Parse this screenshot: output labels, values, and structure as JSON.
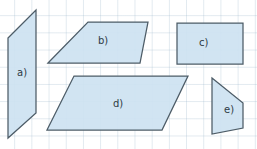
{
  "canvas": {
    "width": 257,
    "height": 149,
    "background_color": "#ffffff",
    "grid_color": "#96b2c8",
    "grid_spacing": 17.2
  },
  "style": {
    "shape_fill": "#cde2f1",
    "shape_stroke": "#4d5c67",
    "label_color": "#2e3b45"
  },
  "shapes": [
    {
      "id": "a",
      "label": "a)",
      "type": "parallelogram",
      "points": "8,38 36,10 36,113 8,138",
      "label_x": 17,
      "label_y": 68
    },
    {
      "id": "b",
      "label": "b)",
      "type": "parallelogram",
      "points": "48,63 88,22 148,22 140,63",
      "label_x": 98,
      "label_y": 36
    },
    {
      "id": "c",
      "label": "c)",
      "type": "rectangle",
      "points": "177,23 243,23 243,64 177,64",
      "label_x": 199,
      "label_y": 38
    },
    {
      "id": "d",
      "label": "d)",
      "type": "parallelogram",
      "points": "47,130 74,76 188,76 162,130",
      "label_x": 113,
      "label_y": 99
    },
    {
      "id": "e",
      "label": "e)",
      "type": "trapezoid",
      "points": "212,78 243,103 243,128 212,134",
      "label_x": 224,
      "label_y": 105
    }
  ]
}
